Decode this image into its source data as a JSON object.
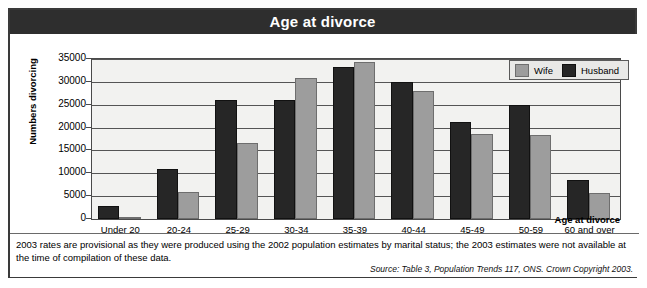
{
  "title": "Age at divorce",
  "axis": {
    "ylabel": "Numbers divorcing",
    "xlabel": "Age at divorce",
    "yticks": [
      "35000",
      "30000",
      "25000",
      "20000",
      "15000",
      "10000",
      "5000",
      "0"
    ]
  },
  "legend": {
    "items": [
      {
        "label": "Wife",
        "color": "#9d9d9d"
      },
      {
        "label": "Husband",
        "color": "#262626"
      }
    ]
  },
  "footnote": "2003 rates are provisional as they were produced using the 2002 population estimates by marital status; the 2003 estimates were not available at the time of compilation of these data.",
  "source": "Source: Table 3, Population Trends 117, ONS. Crown Copyright 2003.",
  "chart_data": {
    "type": "bar",
    "title": "Age at divorce",
    "xlabel": "Age at divorce",
    "ylabel": "Numbers divorcing",
    "ylim": [
      0,
      35000
    ],
    "ytick_step": 5000,
    "grid": true,
    "legend_position": "top-right",
    "categories": [
      "Under 20",
      "20-24",
      "25-29",
      "30-34",
      "35-39",
      "40-44",
      "45-49",
      "50-59",
      "60 and over"
    ],
    "series": [
      {
        "name": "Husband",
        "color": "#262626",
        "values": [
          2900,
          10900,
          26000,
          26000,
          33300,
          30000,
          21300,
          25000,
          8500
        ]
      },
      {
        "name": "Wife",
        "color": "#9d9d9d",
        "values": [
          400,
          6000,
          16700,
          30900,
          34400,
          28000,
          18500,
          18400,
          5700
        ]
      }
    ]
  }
}
